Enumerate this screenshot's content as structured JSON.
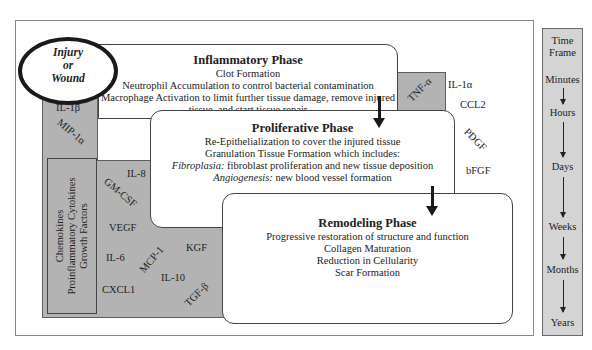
{
  "injury": {
    "line1": "Injury",
    "line2": "or",
    "line3": "Wound"
  },
  "phases": {
    "inflammatory": {
      "title": "Inflammatory Phase",
      "lines": [
        "Clot Formation",
        "Neutrophil Accumulation to control bacterial contamination",
        "Macrophage Activation to limit further tissue damage, remove injured",
        "tissue, and start tissue repair"
      ]
    },
    "proliferative": {
      "title": "Proliferative Phase",
      "lines": [
        "Re-Epithelialization to cover the injured tissue",
        "Granulation Tissue Formation which includes:"
      ],
      "fibroplasia_label": "Fibroplasia:",
      "fibroplasia_text": " fibroblast proliferation and new tissue deposition",
      "angiogenesis_label": "Angiogenesis:",
      "angiogenesis_text": " new blood vessel formation"
    },
    "remodeling": {
      "title": "Remodeling Phase",
      "lines": [
        "Progressive restoration of structure and function",
        "Collagen Maturation",
        "Reduction in Cellularity",
        "Scar Formation"
      ]
    }
  },
  "mediator_legend": {
    "line1": "Chemokines",
    "line2": "Proinflammatory Cytokines",
    "line3": "Growth Factors"
  },
  "mediators": {
    "il1b": "IL-1β",
    "mip1a": "MIP-1α",
    "il8": "IL-8",
    "gmcsf": "GM-CSF",
    "vegf": "VEGF",
    "il6": "IL-6",
    "mcp1": "MCP-1",
    "cxcl1": "CXCL1",
    "il10": "IL-10",
    "kgf": "KGF",
    "tgfb": "TGF-β",
    "tnfa": "TNF-α",
    "il1a": "IL-1α",
    "ccl2": "CCL2",
    "pdgf": "PDGF",
    "bfgf": "bFGF"
  },
  "time_frame": {
    "title1": "Time",
    "title2": "Frame",
    "steps": [
      "Minutes",
      "Hours",
      "Days",
      "Weeks",
      "Months",
      "Years"
    ]
  },
  "colors": {
    "gray_region": "#b3b3b3",
    "time_column": "#d4d4d4",
    "ellipse_border": "#1a1a1a"
  }
}
